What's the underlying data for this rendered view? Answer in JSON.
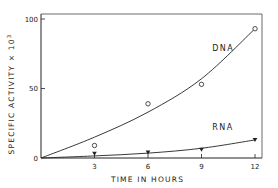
{
  "chart_data": {
    "type": "line",
    "title": "",
    "xlabel": "TIME IN HOURS",
    "ylabel": "SPECIFIC ACTIVITY x 10^3",
    "ylabel_parts": {
      "main": "SPECIFIC ACTIVITY × 10",
      "sup": "3"
    },
    "xlim": [
      0,
      12.5
    ],
    "ylim": [
      0,
      104
    ],
    "x_ticks": [
      3,
      6,
      9,
      12
    ],
    "x_tick_labels": [
      "3",
      "6",
      "9",
      "12"
    ],
    "y_ticks": [
      0,
      50,
      100
    ],
    "y_tick_labels": [
      "0",
      "50",
      "100"
    ],
    "grid": false,
    "series": [
      {
        "name": "DNA",
        "marker": "open-circle",
        "points": {
          "x": [
            3,
            6,
            9,
            12
          ],
          "y": [
            9,
            39,
            53,
            93
          ]
        },
        "curve": {
          "x": [
            0,
            3,
            6,
            9,
            12
          ],
          "y": [
            0,
            15,
            33,
            57,
            93
          ]
        },
        "label_at": {
          "x": 9.6,
          "y": 77
        }
      },
      {
        "name": "RNA",
        "marker": "filled-triangle-down",
        "points": {
          "x": [
            3,
            6,
            9,
            12
          ],
          "y": [
            3,
            4,
            6,
            13
          ]
        },
        "curve": {
          "x": [
            0,
            3,
            6,
            9,
            12
          ],
          "y": [
            0,
            1.5,
            3.5,
            7,
            13
          ]
        },
        "label_at": {
          "x": 9.6,
          "y": 20
        }
      }
    ]
  }
}
